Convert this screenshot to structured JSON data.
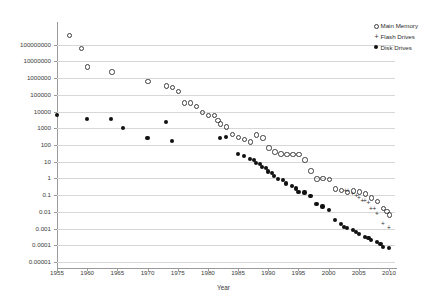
{
  "chart_data": {
    "type": "scatter",
    "title": "",
    "xlabel": "Year",
    "ylabel": "",
    "xlim": [
      1955,
      2011
    ],
    "ylim": [
      1e-05,
      1000000000
    ],
    "yscale": "log",
    "grid": true,
    "legend_position": "right",
    "xticks": [
      1955,
      1960,
      1965,
      1970,
      1975,
      1980,
      1985,
      1990,
      1995,
      2000,
      2005,
      2010
    ],
    "yticks": [
      100000000,
      10000000,
      1000000,
      100000,
      10000,
      1000,
      100,
      10,
      1,
      0.1,
      0.01,
      0.001,
      0.0001,
      1e-05
    ],
    "ytick_labels": [
      "100000000",
      "10000000",
      "1000000",
      "100000",
      "10000",
      "1000",
      "100",
      "10",
      "1",
      "0.1",
      "0.01",
      "0.001",
      "0.0001",
      "0.00001"
    ],
    "series": [
      {
        "name": "Main Memory",
        "marker": "open-circle",
        "color": "#3d3d3d",
        "points": [
          [
            1957,
            400000000
          ],
          [
            1959,
            67000000
          ],
          [
            1960,
            5000000
          ],
          [
            1964,
            2500000
          ],
          [
            1970,
            700000
          ],
          [
            1973,
            370000
          ],
          [
            1974,
            300000
          ],
          [
            1975,
            170000
          ],
          [
            1976,
            35000
          ],
          [
            1977,
            36000
          ],
          [
            1978,
            21000
          ],
          [
            1979,
            9500
          ],
          [
            1980,
            6500
          ],
          [
            1981,
            6300
          ],
          [
            1981.6,
            3200
          ],
          [
            1982,
            2000
          ],
          [
            1983,
            1300
          ],
          [
            1984,
            450
          ],
          [
            1985,
            300
          ],
          [
            1986,
            230
          ],
          [
            1987,
            160
          ],
          [
            1988,
            430
          ],
          [
            1989,
            290
          ],
          [
            1990,
            70
          ],
          [
            1991,
            42
          ],
          [
            1992,
            31
          ],
          [
            1993,
            30
          ],
          [
            1994,
            30
          ],
          [
            1995,
            30
          ],
          [
            1996,
            14
          ],
          [
            1997,
            3.1
          ],
          [
            1998,
            1.0
          ],
          [
            1999,
            1.05
          ],
          [
            2000,
            0.93
          ],
          [
            2001,
            0.25
          ],
          [
            2002,
            0.2
          ],
          [
            2003,
            0.16
          ],
          [
            2004,
            0.19
          ],
          [
            2005,
            0.17
          ],
          [
            2006,
            0.13
          ],
          [
            2007,
            0.075
          ],
          [
            2008,
            0.044
          ],
          [
            2009,
            0.017
          ],
          [
            2009.6,
            0.011
          ],
          [
            2010,
            0.0072
          ]
        ]
      },
      {
        "name": "Flash Drives",
        "marker": "plus",
        "color": "#2d2d2d",
        "points": [
          [
            2002.8,
            0.2
          ],
          [
            2003.2,
            0.2
          ],
          [
            2004,
            0.13
          ],
          [
            2004.6,
            0.1
          ],
          [
            2005,
            0.07
          ],
          [
            2005.6,
            0.048
          ],
          [
            2006,
            0.05
          ],
          [
            2006.6,
            0.034
          ],
          [
            2007,
            0.017
          ],
          [
            2007.6,
            0.016
          ],
          [
            2008,
            0.0075
          ],
          [
            2009,
            0.0019
          ],
          [
            2010,
            0.0012
          ]
        ]
      },
      {
        "name": "Disk Drives",
        "marker": "filled-circle",
        "color": "#111111",
        "points": [
          [
            1955,
            6400
          ],
          [
            1960,
            3600
          ],
          [
            1964,
            3500
          ],
          [
            1966,
            1050
          ],
          [
            1970,
            260
          ],
          [
            1973,
            2400
          ],
          [
            1974,
            180
          ],
          [
            1982,
            270
          ],
          [
            1983,
            310
          ],
          [
            1985,
            29
          ],
          [
            1986,
            23
          ],
          [
            1987,
            15
          ],
          [
            1987.6,
            12
          ],
          [
            1988,
            8.5
          ],
          [
            1988.6,
            7.5
          ],
          [
            1989,
            5.0
          ],
          [
            1989.6,
            4.2
          ],
          [
            1990,
            2.6
          ],
          [
            1990.6,
            2.0
          ],
          [
            1991,
            1.35
          ],
          [
            1991.6,
            0.95
          ],
          [
            1992.4,
            0.84
          ],
          [
            1993,
            0.5
          ],
          [
            1994,
            0.36
          ],
          [
            1994.6,
            0.25
          ],
          [
            1995,
            0.155
          ],
          [
            1996,
            0.145
          ],
          [
            1997,
            0.085
          ],
          [
            1998,
            0.03
          ],
          [
            1999,
            0.021
          ],
          [
            2000,
            0.013
          ],
          [
            2001,
            0.0031
          ],
          [
            2002,
            0.0019
          ],
          [
            2002.6,
            0.0013
          ],
          [
            2003,
            0.0011
          ],
          [
            2004,
            0.00085
          ],
          [
            2004.6,
            0.0006
          ],
          [
            2005,
            0.00048
          ],
          [
            2006,
            0.00031
          ],
          [
            2006.6,
            0.00026
          ],
          [
            2007,
            0.00021
          ],
          [
            2008,
            0.000155
          ],
          [
            2008.6,
            0.00012
          ],
          [
            2009,
            8e-05
          ],
          [
            2010,
            7e-05
          ]
        ]
      }
    ]
  },
  "legend": {
    "items": [
      {
        "label": "Main Memory",
        "marker": "open-circle"
      },
      {
        "label": "Flash Drives",
        "marker": "plus"
      },
      {
        "label": "Disk Drives",
        "marker": "filled-circle"
      }
    ]
  },
  "axis": {
    "x_title": "Year"
  }
}
